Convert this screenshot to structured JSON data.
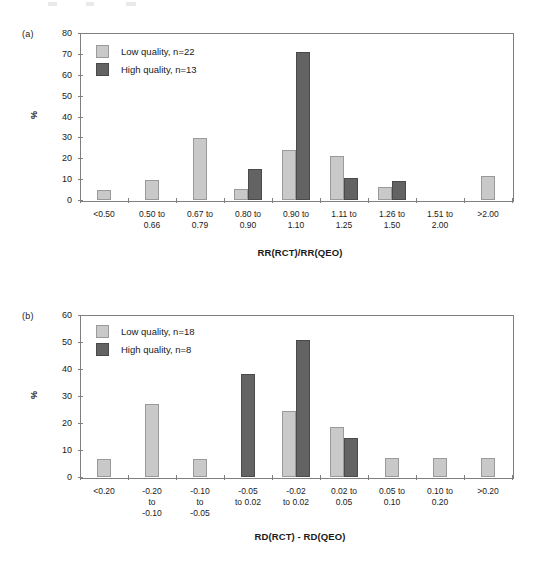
{
  "figure": {
    "background": "#ffffff",
    "colors": {
      "low_quality": "#c9c9c9",
      "high_quality": "#636363",
      "axis": "#808080",
      "text": "#1a1a1a"
    }
  },
  "panels": [
    {
      "tag": "(a)",
      "ylabel": "%",
      "xlabel": "RR(RCT)/RR(QEO)",
      "legend": [
        {
          "label": "Low quality, n=22",
          "series": "low"
        },
        {
          "label": "High quality, n=13",
          "series": "high"
        }
      ],
      "chart_data": {
        "type": "bar",
        "title": "",
        "xlabel": "RR(RCT)/RR(QEO)",
        "ylabel": "%",
        "ylim": [
          0,
          80
        ],
        "yticks": [
          0,
          10,
          20,
          30,
          40,
          50,
          60,
          70,
          80
        ],
        "grid": false,
        "legend_position": "top-left",
        "categories": [
          "<0.50",
          "0.50 to\n0.66",
          "0.67 to\n0.79",
          "0.80 to\n0.90",
          "0.90 to\n1.10",
          "1.11 to\n1.25",
          "1.26 to\n1.50",
          "1.51 to\n2.00",
          ">2.00"
        ],
        "series": [
          {
            "name": "Low quality, n=22",
            "values": [
              5,
              9.5,
              29.5,
              5.5,
              24,
              21,
              6,
              0,
              11.5
            ]
          },
          {
            "name": "High quality, n=13",
            "values": [
              0,
              0,
              0,
              15,
              71,
              10.5,
              9,
              0,
              0
            ]
          }
        ]
      }
    },
    {
      "tag": "(b)",
      "ylabel": "%",
      "xlabel": "RD(RCT) - RD(QEO)",
      "legend": [
        {
          "label": "Low quality, n=18",
          "series": "low"
        },
        {
          "label": "High quality, n=8",
          "series": "high"
        }
      ],
      "chart_data": {
        "type": "bar",
        "title": "",
        "xlabel": "RD(RCT) - RD(QEO)",
        "ylabel": "%",
        "ylim": [
          0,
          60
        ],
        "yticks": [
          0,
          10,
          20,
          30,
          40,
          50,
          60
        ],
        "grid": false,
        "legend_position": "top-left",
        "categories": [
          "<0.20",
          "-0.20\nto\n-0.10",
          "-0.10\nto\n-0.05",
          "-0.05\nto 0.02",
          "-0.02\nto 0.02",
          "0.02 to\n0.05",
          "0.05 to\n0.10",
          "0.10 to\n0.20",
          ">0.20"
        ],
        "series": [
          {
            "name": "Low quality, n=18",
            "values": [
              6.8,
              27.2,
              6.6,
              0,
              24.4,
              18.5,
              7.2,
              7.2,
              7.2
            ]
          },
          {
            "name": "High quality, n=8",
            "values": [
              0,
              0,
              0,
              38.2,
              50.8,
              14.5,
              0,
              0,
              0
            ]
          }
        ]
      }
    }
  ]
}
